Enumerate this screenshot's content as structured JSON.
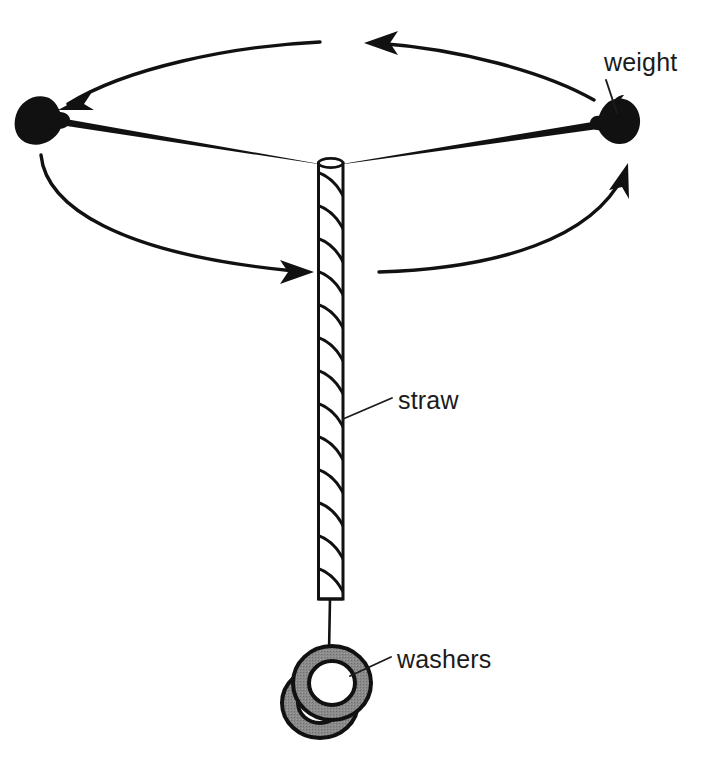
{
  "figure": {
    "kind": "science-illustration",
    "background_color": "#ffffff",
    "ink_color": "#111111",
    "washer_fill_color": "#8a8a8a"
  },
  "labels": {
    "weight": "weight",
    "straw": "straw",
    "washers": "washers"
  },
  "parts": {
    "straw": {
      "name": "straw",
      "x_left": 318,
      "x_right": 343,
      "y_top": 162,
      "y_bottom": 600,
      "stripe_pattern": "diagonal spiral",
      "stripe_count": 13
    },
    "weight_left": {
      "name": "weight",
      "cx": 42,
      "cy": 118
    },
    "weight_right": {
      "name": "weight",
      "cx": 613,
      "cy": 123
    },
    "arm_left": {
      "from_x": 330,
      "from_y": 165,
      "to_x": 60,
      "to_y": 121
    },
    "arm_right": {
      "from_x": 330,
      "from_y": 165,
      "to_x": 596,
      "to_y": 126
    },
    "string": {
      "from_x": 330,
      "from_y": 600,
      "to_x": 330,
      "to_y": 655
    },
    "washers": {
      "count": 2,
      "cx": 330,
      "cy": 688,
      "outer_r": 38,
      "inner_r": 23
    }
  },
  "rotation_arrows": [
    {
      "id": "arrow-top-left",
      "direction": "left",
      "head_at_x": 62,
      "head_at_y": 104
    },
    {
      "id": "arrow-top-right",
      "direction": "left",
      "head_at_x": 365,
      "head_at_y": 43
    },
    {
      "id": "arrow-bottom-left",
      "direction": "right",
      "head_at_x": 312,
      "head_at_y": 272
    },
    {
      "id": "arrow-bottom-right",
      "direction": "up-right",
      "head_at_x": 628,
      "head_at_y": 164
    }
  ],
  "leader_lines": [
    {
      "label": "weight",
      "from_x": 606,
      "from_y": 78,
      "to_x": 616,
      "to_y": 112
    },
    {
      "label": "straw",
      "from_x": 392,
      "from_y": 398,
      "to_x": 342,
      "to_y": 418
    },
    {
      "label": "washers",
      "from_x": 391,
      "from_y": 657,
      "to_x": 352,
      "to_y": 675
    }
  ]
}
